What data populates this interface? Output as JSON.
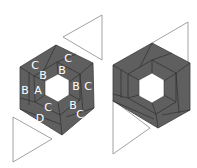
{
  "figure": {
    "colors": {
      "fabric": "#5f5f5f",
      "seam": "#2f2f2f",
      "center": "#ffffff",
      "triangle_outline": "#8a8a8a",
      "label": "#ffffff"
    },
    "left_block": {
      "labels": [
        {
          "text": "C",
          "x": 35,
          "y": 65
        },
        {
          "text": "C",
          "x": 68,
          "y": 58
        },
        {
          "text": "B",
          "x": 43,
          "y": 75
        },
        {
          "text": "B",
          "x": 62,
          "y": 70
        },
        {
          "text": "B",
          "x": 77,
          "y": 86
        },
        {
          "text": "C",
          "x": 89,
          "y": 86
        },
        {
          "text": "B",
          "x": 26,
          "y": 90
        },
        {
          "text": "A",
          "x": 38,
          "y": 90
        },
        {
          "text": "C",
          "x": 48,
          "y": 107
        },
        {
          "text": "B",
          "x": 73,
          "y": 105
        },
        {
          "text": "D",
          "x": 40,
          "y": 118
        },
        {
          "text": "C",
          "x": 80,
          "y": 114
        }
      ]
    },
    "right_block": {
      "labels": []
    }
  }
}
